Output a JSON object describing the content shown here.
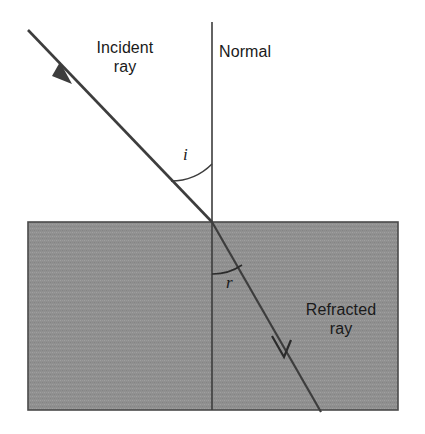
{
  "diagram": {
    "labels": {
      "incident_ray": "Incident\nray",
      "normal": "Normal",
      "refracted_ray": "Refracted\nray",
      "angle_of_incidence": "i",
      "angle_of_refraction": "r"
    },
    "colors": {
      "line": "#3d3d3d",
      "medium_fill": "#909090",
      "medium_border": "#4a4a4a",
      "background": "#ffffff",
      "text": "#1a1a1a"
    },
    "geometry": {
      "boundary_surface_y": 222,
      "incidence_point": {
        "x": 212,
        "y": 222
      },
      "medium_block": {
        "x": 28,
        "y": 222,
        "width": 370,
        "height": 188
      },
      "normal_line": {
        "x": 212,
        "y_top": 22,
        "y_bottom": 410
      },
      "incident_ray": {
        "x1": 28,
        "y1": 30,
        "x2": 212,
        "y2": 222
      },
      "incident_arrow_tip": {
        "x": 70,
        "y": 82
      },
      "refracted_ray": {
        "x1": 212,
        "y1": 222,
        "x2": 320,
        "y2": 410
      },
      "refracted_arrow_tip": {
        "x": 284,
        "y": 356
      },
      "angle_i_arc_radius": 58,
      "angle_r_arc_radius": 52,
      "angle_of_incidence_degrees": 44,
      "angle_of_refraction_degrees": 30
    }
  }
}
